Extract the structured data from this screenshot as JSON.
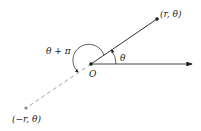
{
  "diagram": {
    "labels": {
      "point_positive": "(r, θ)",
      "point_negative": "(−r, θ)",
      "origin": "O",
      "angle_theta": "θ",
      "angle_theta_plus_pi": "θ + π"
    },
    "colors": {
      "line": "#1a1a1a",
      "dashed": "#888888",
      "point_negative": "#888888"
    }
  }
}
